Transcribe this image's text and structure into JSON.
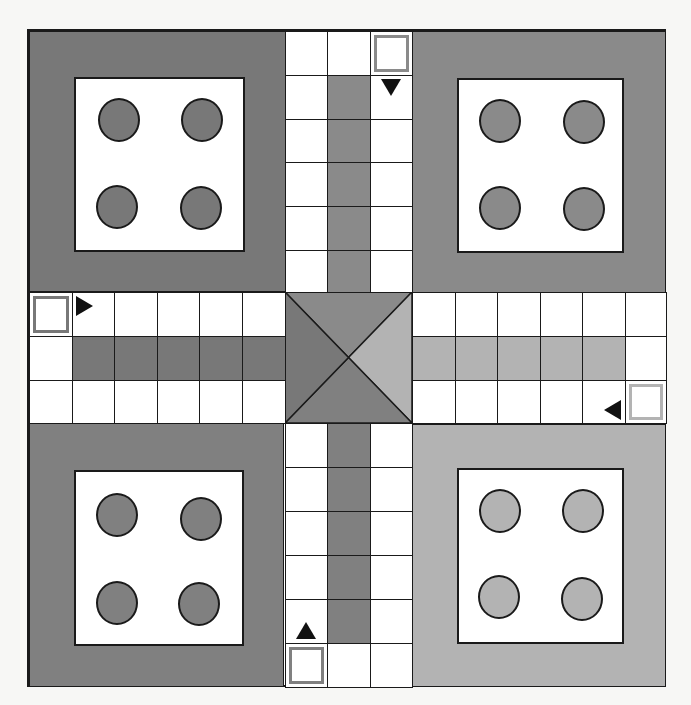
{
  "game": {
    "type": "ludo-board",
    "grid_size": 15,
    "colors": {
      "top_left": "#787878",
      "top_right": "#8a8a8a",
      "bottom_left": "#808080",
      "bottom_right": "#b3b3b3",
      "line": "#1a1a1a",
      "track": "#ffffff",
      "arrow": "#111111"
    },
    "players": [
      {
        "id": "top-left",
        "color_key": "top_left",
        "tokens_in_yard": 4,
        "start_arrow": "right",
        "home_column": "left-arm-middle-row"
      },
      {
        "id": "top-right",
        "color_key": "top_right",
        "tokens_in_yard": 4,
        "start_arrow": "down",
        "home_column": "top-arm-middle-column"
      },
      {
        "id": "bottom-right",
        "color_key": "bottom_right",
        "tokens_in_yard": 4,
        "start_arrow": "left",
        "home_column": "right-arm-middle-row"
      },
      {
        "id": "bottom-left",
        "color_key": "bottom_left",
        "tokens_in_yard": 4,
        "start_arrow": "up",
        "home_column": "bottom-arm-middle-column"
      }
    ],
    "center": {
      "triangles": [
        {
          "side": "top",
          "color_key": "top_right"
        },
        {
          "side": "right",
          "color_key": "bottom_right"
        },
        {
          "side": "bottom",
          "color_key": "bottom_left"
        },
        {
          "side": "left",
          "color_key": "top_left"
        }
      ]
    }
  }
}
